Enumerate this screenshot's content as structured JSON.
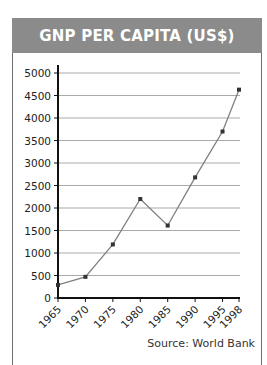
{
  "header": {
    "title": "GNP PER CAPITA (US$)"
  },
  "source": "Source: World Bank",
  "colors": {
    "header_bg": "#8b8b8b",
    "line": "#808080",
    "point": "#333333",
    "grid": "#aaaaaa",
    "axis": "#111111"
  },
  "chart_data": {
    "type": "line",
    "title": "GNP PER CAPITA (US$)",
    "xlabel": "",
    "ylabel": "",
    "categories": [
      "1965",
      "1970",
      "1975",
      "1980",
      "1985",
      "1990",
      "1995",
      "1998"
    ],
    "x": [
      1965,
      1970,
      1975,
      1980,
      1985,
      1990,
      1995,
      1998
    ],
    "series": [
      {
        "name": "GNP per capita (US$)",
        "values": [
          290,
          470,
          1190,
          2200,
          1610,
          2680,
          3700,
          4630
        ]
      }
    ],
    "yticks": [
      0,
      500,
      1000,
      1500,
      2000,
      2500,
      3000,
      3500,
      4000,
      4500,
      5000
    ],
    "ylim": [
      0,
      5000
    ],
    "xlim": [
      1965,
      1998
    ],
    "grid": true,
    "legend": "none",
    "annotation": "Source: World Bank"
  }
}
